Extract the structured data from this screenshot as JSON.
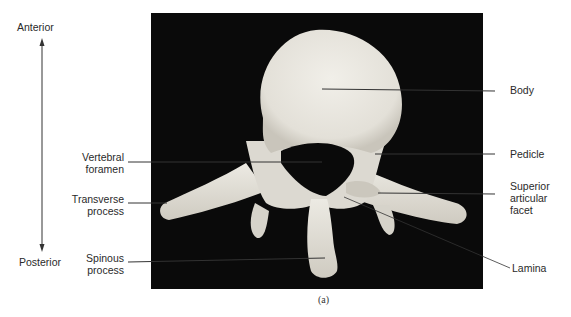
{
  "figure": {
    "caption": "(a)",
    "orientation": {
      "top_label": "Anterior",
      "bottom_label": "Posterior"
    },
    "labels_left": [
      {
        "id": "vertebral-foramen",
        "text": "Vertebral\nforamen",
        "line1": "Vertebral",
        "line2": "foramen"
      },
      {
        "id": "transverse-process",
        "text": "Transverse\nprocess",
        "line1": "Transverse",
        "line2": "process"
      },
      {
        "id": "spinous-process",
        "text": "Spinous\nprocess",
        "line1": "Spinous",
        "line2": "process"
      }
    ],
    "labels_right": [
      {
        "id": "body",
        "line1": "Body"
      },
      {
        "id": "pedicle",
        "line1": "Pedicle"
      },
      {
        "id": "superior-articular-facet",
        "line1": "Superior",
        "line2": "articular",
        "line3": "facet"
      },
      {
        "id": "lamina",
        "line1": "Lamina"
      }
    ],
    "colors": {
      "background": "#ffffff",
      "photo_background": "#0a0a0a",
      "bone": "#e9e7e0",
      "leader_line": "#333333",
      "text": "#2a2a2a"
    }
  }
}
